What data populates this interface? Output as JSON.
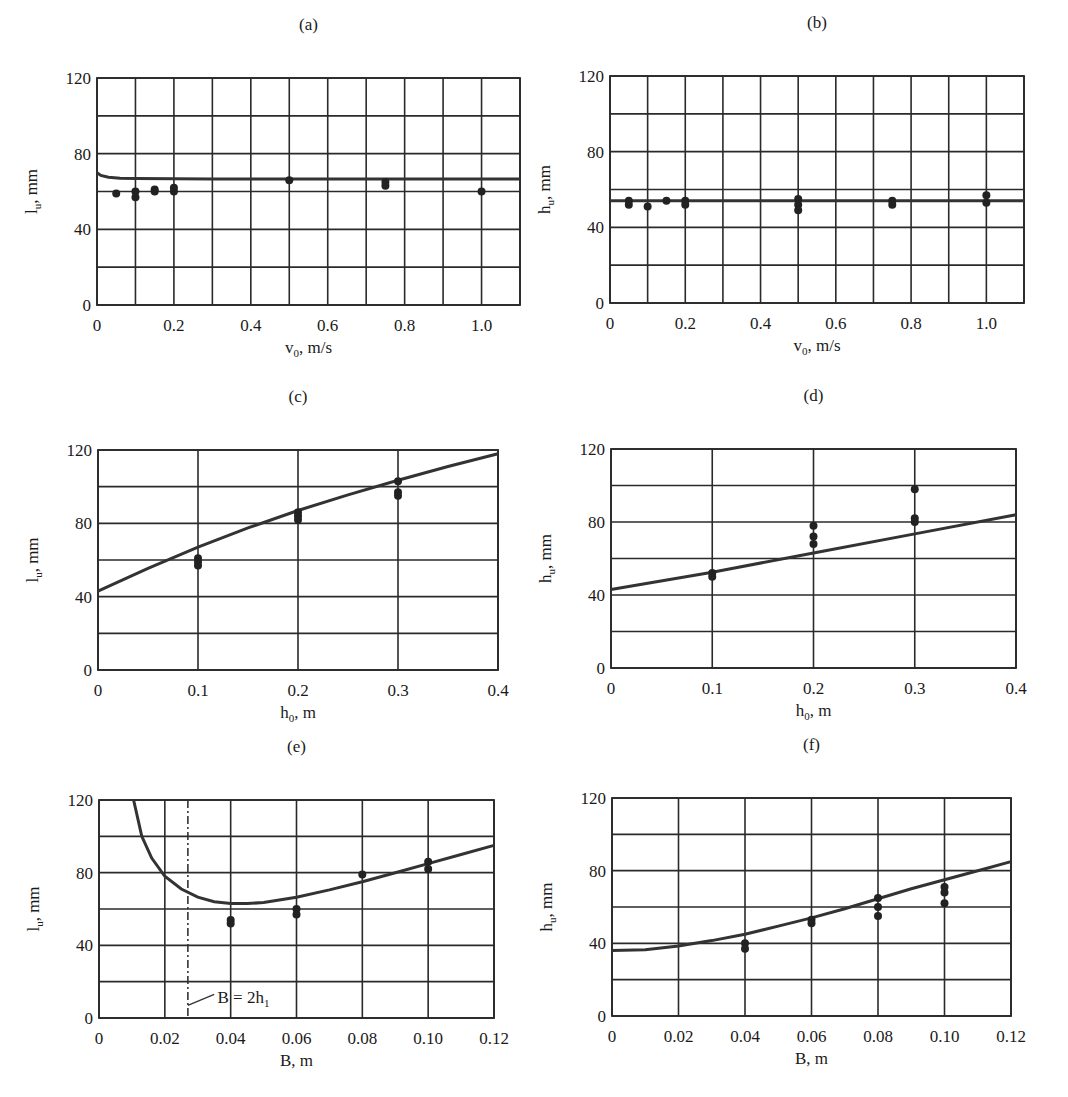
{
  "figure": {
    "panels": [
      "a",
      "b",
      "c",
      "d",
      "e",
      "f"
    ]
  },
  "chart_data": [
    {
      "id": "a",
      "type": "scatter",
      "title": "(a)",
      "xlabel": "v0, m/s",
      "xlabel_main": "v",
      "xlabel_sub": "0",
      "xlabel_rest": ", m/s",
      "ylabel": "lu, mm",
      "ylabel_main": "l",
      "ylabel_sub": "u",
      "ylabel_rest": ", mm",
      "xlim": [
        0,
        1.1
      ],
      "ylim": [
        0,
        120
      ],
      "x_ticks": [
        0,
        0.2,
        0.4,
        0.6,
        0.8,
        1.0
      ],
      "x_tick_labels": [
        "0",
        "0.2",
        "0.4",
        "0.6",
        "0.8",
        "1.0"
      ],
      "x_grid_step": 0.1,
      "y_ticks": [
        0,
        40,
        80,
        120
      ],
      "y_tick_labels": [
        "0",
        "40",
        "80",
        "120"
      ],
      "y_grid_step": 20,
      "grid": true,
      "points": [
        [
          0.05,
          59
        ],
        [
          0.1,
          60
        ],
        [
          0.1,
          57
        ],
        [
          0.15,
          60
        ],
        [
          0.15,
          61
        ],
        [
          0.2,
          60
        ],
        [
          0.2,
          62
        ],
        [
          0.5,
          66
        ],
        [
          0.75,
          63
        ],
        [
          0.75,
          65
        ],
        [
          1.0,
          60
        ]
      ],
      "curve": [
        [
          0.0,
          70
        ],
        [
          0.01,
          68.5
        ],
        [
          0.03,
          67.5
        ],
        [
          0.06,
          67
        ],
        [
          0.1,
          66.8
        ],
        [
          0.3,
          66.6
        ],
        [
          0.6,
          66.6
        ],
        [
          1.1,
          66.6
        ]
      ]
    },
    {
      "id": "b",
      "type": "scatter",
      "title": "(b)",
      "xlabel": "v0, m/s",
      "xlabel_main": "v",
      "xlabel_sub": "0",
      "xlabel_rest": ", m/s",
      "ylabel": "hu, mm",
      "ylabel_main": "h",
      "ylabel_sub": "u",
      "ylabel_rest": ", mm",
      "xlim": [
        0,
        1.1
      ],
      "ylim": [
        0,
        120
      ],
      "x_ticks": [
        0,
        0.2,
        0.4,
        0.6,
        0.8,
        1.0
      ],
      "x_tick_labels": [
        "0",
        "0.2",
        "0.4",
        "0.6",
        "0.8",
        "1.0"
      ],
      "x_grid_step": 0.1,
      "y_ticks": [
        0,
        40,
        80,
        120
      ],
      "y_tick_labels": [
        "0",
        "40",
        "80",
        "120"
      ],
      "y_grid_step": 20,
      "grid": true,
      "points": [
        [
          0.05,
          54
        ],
        [
          0.05,
          52
        ],
        [
          0.1,
          51
        ],
        [
          0.15,
          54
        ],
        [
          0.2,
          54
        ],
        [
          0.2,
          52
        ],
        [
          0.5,
          55
        ],
        [
          0.5,
          52
        ],
        [
          0.5,
          49
        ],
        [
          0.75,
          54
        ],
        [
          0.75,
          52
        ],
        [
          1.0,
          57
        ],
        [
          1.0,
          53
        ]
      ],
      "curve": [
        [
          0.0,
          54
        ],
        [
          1.1,
          54
        ]
      ]
    },
    {
      "id": "c",
      "type": "scatter",
      "title": "(c)",
      "xlabel": "h0, m",
      "xlabel_main": "h",
      "xlabel_sub": "0",
      "xlabel_rest": ", m",
      "ylabel": "lu, mm",
      "ylabel_main": "l",
      "ylabel_sub": "u",
      "ylabel_rest": ", mm",
      "xlim": [
        0,
        0.4
      ],
      "ylim": [
        0,
        120
      ],
      "x_ticks": [
        0,
        0.1,
        0.2,
        0.3,
        0.4
      ],
      "x_tick_labels": [
        "0",
        "0.1",
        "0.2",
        "0.3",
        "0.4"
      ],
      "x_grid_step": 0.1,
      "y_ticks": [
        0,
        40,
        80,
        120
      ],
      "y_tick_labels": [
        "0",
        "40",
        "80",
        "120"
      ],
      "y_grid_step": 20,
      "grid": true,
      "points": [
        [
          0.1,
          61
        ],
        [
          0.1,
          59
        ],
        [
          0.1,
          57
        ],
        [
          0.2,
          86
        ],
        [
          0.2,
          84
        ],
        [
          0.2,
          82
        ],
        [
          0.3,
          103
        ],
        [
          0.3,
          97
        ],
        [
          0.3,
          95
        ]
      ],
      "curve": [
        [
          0.0,
          43
        ],
        [
          0.05,
          55.5
        ],
        [
          0.1,
          67
        ],
        [
          0.15,
          77.5
        ],
        [
          0.2,
          87
        ],
        [
          0.25,
          95.5
        ],
        [
          0.3,
          103.5
        ],
        [
          0.35,
          111
        ],
        [
          0.4,
          118
        ]
      ]
    },
    {
      "id": "d",
      "type": "scatter",
      "title": "(d)",
      "xlabel": "h0, m",
      "xlabel_main": "h",
      "xlabel_sub": "0",
      "xlabel_rest": ", m",
      "ylabel": "hu, mm",
      "ylabel_main": "h",
      "ylabel_sub": "u",
      "ylabel_rest": ", mm",
      "xlim": [
        0,
        0.4
      ],
      "ylim": [
        0,
        120
      ],
      "x_ticks": [
        0,
        0.1,
        0.2,
        0.3,
        0.4
      ],
      "x_tick_labels": [
        "0",
        "0.1",
        "0.2",
        "0.3",
        "0.4"
      ],
      "x_grid_step": 0.1,
      "y_ticks": [
        0,
        40,
        80,
        120
      ],
      "y_tick_labels": [
        "0",
        "40",
        "80",
        "120"
      ],
      "y_grid_step": 20,
      "grid": true,
      "points": [
        [
          0.1,
          52
        ],
        [
          0.1,
          50
        ],
        [
          0.2,
          78
        ],
        [
          0.2,
          72
        ],
        [
          0.2,
          68
        ],
        [
          0.3,
          98
        ],
        [
          0.3,
          82
        ],
        [
          0.3,
          80
        ]
      ],
      "curve": [
        [
          0.0,
          43
        ],
        [
          0.1,
          52.5
        ],
        [
          0.2,
          63
        ],
        [
          0.3,
          73.5
        ],
        [
          0.4,
          84
        ]
      ]
    },
    {
      "id": "e",
      "type": "scatter",
      "title": "(e)",
      "xlabel": "B, m",
      "xlabel_main": "B",
      "xlabel_sub": "",
      "xlabel_rest": ", m",
      "ylabel": "lu, mm",
      "ylabel_main": "l",
      "ylabel_sub": "u",
      "ylabel_rest": ", mm",
      "xlim": [
        0,
        0.12
      ],
      "ylim": [
        0,
        120
      ],
      "x_ticks": [
        0,
        0.02,
        0.04,
        0.06,
        0.08,
        0.1,
        0.12
      ],
      "x_tick_labels": [
        "0",
        "0.02",
        "0.04",
        "0.06",
        "0.08",
        "0.10",
        "0.12"
      ],
      "x_grid_step": 0.02,
      "y_ticks": [
        0,
        40,
        80,
        120
      ],
      "y_tick_labels": [
        "0",
        "40",
        "80",
        "120"
      ],
      "y_grid_step": 20,
      "grid": true,
      "points": [
        [
          0.04,
          54
        ],
        [
          0.04,
          52
        ],
        [
          0.06,
          60
        ],
        [
          0.06,
          57
        ],
        [
          0.08,
          79
        ],
        [
          0.1,
          86
        ],
        [
          0.1,
          82
        ]
      ],
      "curve": [
        [
          0.0105,
          120
        ],
        [
          0.013,
          100
        ],
        [
          0.016,
          88
        ],
        [
          0.02,
          78
        ],
        [
          0.025,
          71
        ],
        [
          0.03,
          66.5
        ],
        [
          0.035,
          64
        ],
        [
          0.04,
          63
        ],
        [
          0.045,
          63
        ],
        [
          0.05,
          63.5
        ],
        [
          0.06,
          66.5
        ],
        [
          0.07,
          70.5
        ],
        [
          0.08,
          75
        ],
        [
          0.09,
          80
        ],
        [
          0.1,
          85
        ],
        [
          0.11,
          90
        ],
        [
          0.12,
          95
        ]
      ],
      "vline": {
        "x": 0.027,
        "style": "dash-dot"
      },
      "annotation": {
        "text": "B = 2h1",
        "main": "B = 2h",
        "sub": "1",
        "x": 0.036,
        "y": 8,
        "leader_from": [
          0.027,
          7
        ],
        "leader_to": [
          0.035,
          13
        ]
      }
    },
    {
      "id": "f",
      "type": "scatter",
      "title": "(f)",
      "xlabel": "B, m",
      "xlabel_main": "B",
      "xlabel_sub": "",
      "xlabel_rest": ", m",
      "ylabel": "hu, mm",
      "ylabel_main": "h",
      "ylabel_sub": "u",
      "ylabel_rest": ", mm",
      "xlim": [
        0,
        0.12
      ],
      "ylim": [
        0,
        120
      ],
      "x_ticks": [
        0,
        0.02,
        0.04,
        0.06,
        0.08,
        0.1,
        0.12
      ],
      "x_tick_labels": [
        "0",
        "0.02",
        "0.04",
        "0.06",
        "0.08",
        "0.10",
        "0.12"
      ],
      "x_grid_step": 0.02,
      "y_ticks": [
        0,
        40,
        80,
        120
      ],
      "y_tick_labels": [
        "0",
        "40",
        "80",
        "120"
      ],
      "y_grid_step": 20,
      "grid": true,
      "points": [
        [
          0.04,
          40
        ],
        [
          0.04,
          37
        ],
        [
          0.06,
          53
        ],
        [
          0.06,
          51
        ],
        [
          0.08,
          65
        ],
        [
          0.08,
          60
        ],
        [
          0.08,
          55
        ],
        [
          0.1,
          71
        ],
        [
          0.1,
          68
        ],
        [
          0.1,
          62
        ]
      ],
      "curve": [
        [
          0.0,
          36
        ],
        [
          0.01,
          36.5
        ],
        [
          0.02,
          38.5
        ],
        [
          0.03,
          41.5
        ],
        [
          0.04,
          45
        ],
        [
          0.05,
          49.5
        ],
        [
          0.06,
          54
        ],
        [
          0.07,
          59
        ],
        [
          0.08,
          64.5
        ],
        [
          0.09,
          70
        ],
        [
          0.1,
          75
        ],
        [
          0.11,
          80
        ],
        [
          0.12,
          85
        ]
      ]
    }
  ]
}
